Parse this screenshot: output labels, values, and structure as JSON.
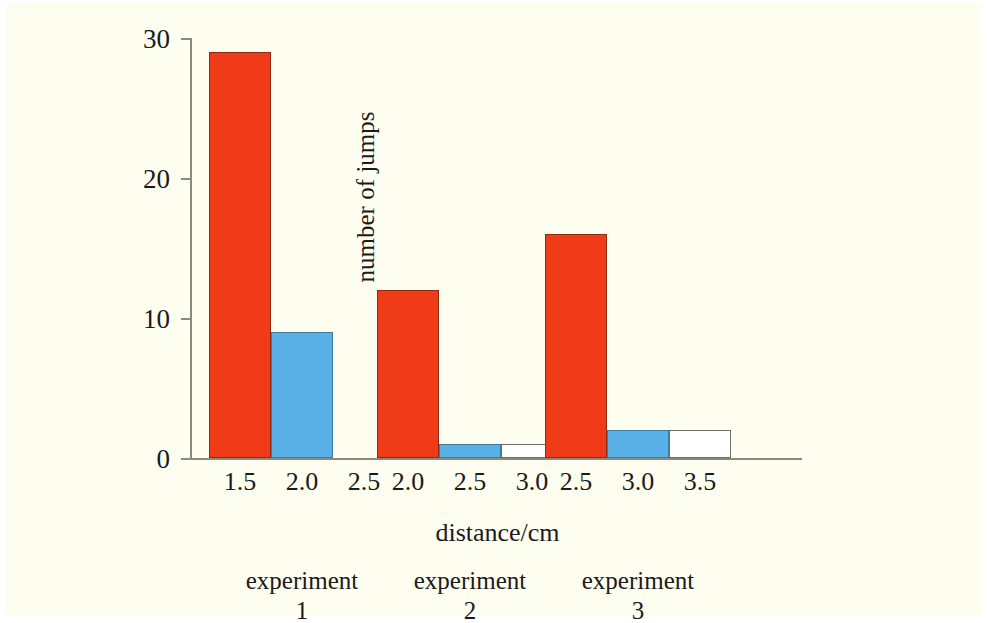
{
  "chart_data": {
    "type": "bar",
    "title": "",
    "xlabel": "distance/cm",
    "ylabel": "number of jumps",
    "ylim": [
      0,
      30
    ],
    "yticks": [
      0,
      10,
      20,
      30
    ],
    "ytick_labels": [
      "0",
      "10",
      "20",
      "30"
    ],
    "grid": false,
    "legend": null,
    "background_color": "#fdfdf0",
    "colors": {
      "red": "#f03b18",
      "blue": "#58b0e6",
      "white": "#ffffff",
      "axis": "#8a8a80",
      "text": "#1a1a1a"
    },
    "groups": [
      {
        "caption_line1": "experiment",
        "caption_line2": "1",
        "categories": [
          "1.5",
          "2.0",
          "2.5"
        ],
        "values": [
          29,
          9,
          0
        ],
        "bar_colors": [
          "red",
          "blue",
          "white"
        ]
      },
      {
        "caption_line1": "experiment",
        "caption_line2": "2",
        "categories": [
          "2.0",
          "2.5",
          "3.0"
        ],
        "values": [
          12,
          1,
          1
        ],
        "bar_colors": [
          "red",
          "blue",
          "white"
        ]
      },
      {
        "caption_line1": "experiment",
        "caption_line2": "3",
        "categories": [
          "2.5",
          "3.0",
          "3.5"
        ],
        "values": [
          16,
          2,
          2
        ],
        "bar_colors": [
          "red",
          "blue",
          "white"
        ]
      }
    ]
  }
}
